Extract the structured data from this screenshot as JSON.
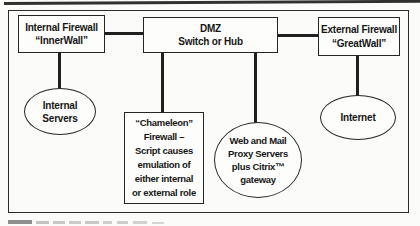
{
  "figure": {
    "nodes": {
      "internal_firewall": {
        "line1": "Internal Firewall",
        "line2": "“InnerWall”"
      },
      "dmz_switch": {
        "line1": "DMZ",
        "line2": "Switch or Hub"
      },
      "external_firewall": {
        "line1": "External Firewall",
        "line2": "“GreatWall”"
      },
      "internal_servers": {
        "line1": "Internal",
        "line2": "Servers"
      },
      "internet": {
        "line1": "Internet"
      },
      "chameleon_firewall": {
        "lines": [
          "“Chameleon”",
          "Firewall –",
          "Script causes",
          "emulation of",
          "either internal",
          "or external role"
        ]
      },
      "web_mail_proxy": {
        "lines": [
          "Web and Mail",
          "Proxy Servers",
          "plus Citrix™",
          "gateway"
        ]
      }
    },
    "colors": {
      "ink": "#1f1f1f",
      "background": "#fbfbfa",
      "caption_marks": "#9a9a9a"
    }
  }
}
